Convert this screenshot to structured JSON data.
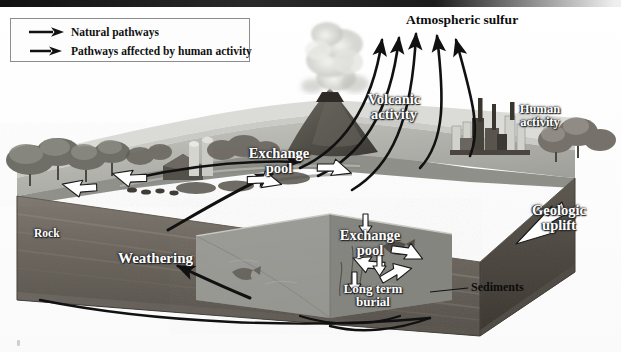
{
  "diagram": {
    "legend": {
      "items": [
        {
          "label": "Natural pathways",
          "icon": "black-arrow-icon",
          "style": "natural"
        },
        {
          "label": "Pathways affected by human activity",
          "icon": "black-arrow-icon",
          "style": "human"
        }
      ]
    },
    "labels": {
      "atmospheric_sulfur": "Atmospheric sulfur",
      "volcanic_activity": "Volcanic\nactivity",
      "volcanic_activity_line1": "Volcanic",
      "volcanic_activity_line2": "activity",
      "human_activity_line1": "Human",
      "human_activity_line2": "activity",
      "exchange_pool_upper_line1": "Exchange",
      "exchange_pool_upper_line2": "pool",
      "exchange_pool_lower_line1": "Exchange",
      "exchange_pool_lower_line2": "pool",
      "geologic_uplift_line1": "Geologic",
      "geologic_uplift_line2": "uplift",
      "long_term_burial_line1": "Long term",
      "long_term_burial_line2": "burial",
      "weathering": "Weathering",
      "rock": "Rock",
      "sediments": "Sediments"
    },
    "colors": {
      "background": "#ffffff",
      "legend_border": "#8d8d8d",
      "arrow_black": "#111111",
      "arrow_white_fill": "#ffffff",
      "arrow_white_stroke": "#1a1a1a",
      "label_white": "#ffffff",
      "label_black": "#0c0c0c",
      "land_light": "#b9b9b4",
      "land_mid": "#9a9a95",
      "rock_face": "#6f6a63",
      "rock_face_dark": "#4a4640",
      "water": "#8e8e8a",
      "sky": "#ffffff"
    },
    "counts": {
      "atmospheric_arrows": 5,
      "exchange_pools": 2
    },
    "scene_elements": [
      "sky",
      "trees-left",
      "farm-barn",
      "farm-silos",
      "cattle",
      "river",
      "volcano",
      "ash-plume",
      "factory",
      "smokestacks",
      "trees-right",
      "rock-block",
      "water-body",
      "fish",
      "sediments-layer"
    ]
  }
}
